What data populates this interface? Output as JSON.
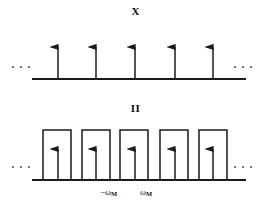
{
  "figure": {
    "background_color": "#ffffff",
    "stroke_color": "#1a1a1a",
    "panels": [
      {
        "name": "top-panel",
        "title": "X",
        "type": "impulse-train",
        "baseline_y": 79,
        "axis_x_start": 32,
        "axis_x_end": 246,
        "impulse_positions_x": [
          58,
          96,
          135,
          175,
          213
        ],
        "impulse_top_y": 40,
        "left_ellipsis": "· · ·",
        "right_ellipsis": "· · ·"
      },
      {
        "name": "bottom-panel",
        "title": "II",
        "type": "impulse-train-with-rect-envelope",
        "baseline_y": 180,
        "axis_x_start": 32,
        "axis_x_end": 246,
        "impulse_positions_x": [
          58,
          96,
          135,
          175,
          213
        ],
        "impulse_top_y": 142,
        "rect_top_y": 130,
        "rect_half_width": 14,
        "rect_centers_x": [
          57,
          96,
          134,
          174,
          213
        ],
        "left_ellipsis": "· · ·",
        "right_ellipsis": "· · ·",
        "axis_labels": [
          {
            "name": "neg-omega-m",
            "symbol": "−ω",
            "subscript": "M"
          },
          {
            "name": "pos-omega-m",
            "symbol": "ω",
            "subscript": "M"
          }
        ]
      }
    ]
  }
}
